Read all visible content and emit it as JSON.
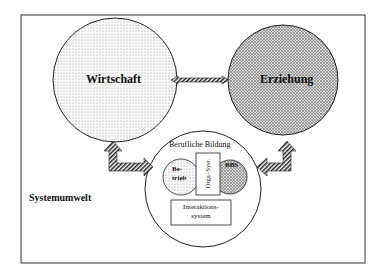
{
  "diagram": {
    "type": "system-diagram",
    "environment_label": "Systemumwelt",
    "nodes": {
      "wirtschaft": {
        "label": "Wirtschaft",
        "fill": "dotted-light"
      },
      "erziehung": {
        "label": "Erziehung",
        "fill": "crosshatch-dark"
      },
      "berufliche_bildung": {
        "label": "Berufliche Bildung",
        "betrieb": {
          "label_line1": "Be-",
          "label_line2": "trieb"
        },
        "orga_syst": {
          "label": "Orga.-Syst."
        },
        "bbs": {
          "label": "BBS"
        },
        "interaktionssystem": {
          "label_line1": "Interaktions-",
          "label_line2": "system"
        }
      }
    },
    "edges": [
      {
        "from": "Wirtschaft",
        "to": "Erziehung",
        "style": "double-headed hatched arrow"
      },
      {
        "from": "Wirtschaft",
        "to": "Berufliche Bildung",
        "style": "bent double-headed hatched arrow"
      },
      {
        "from": "Erziehung",
        "to": "Berufliche Bildung",
        "style": "bent double-headed hatched arrow"
      }
    ],
    "colors": {
      "stroke": "#222222",
      "background": "#ffffff"
    }
  }
}
